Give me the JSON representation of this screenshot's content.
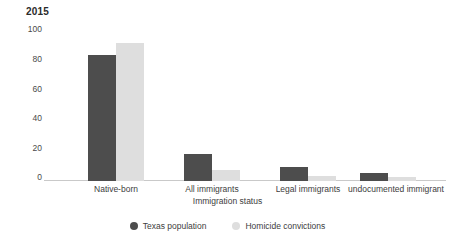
{
  "chart_data": {
    "type": "bar",
    "title": "2015",
    "xlabel": "Immigration status",
    "ylabel": "",
    "categories": [
      "Native-born",
      "All immigrants",
      "Legal immigrants",
      "undocumented immigrant"
    ],
    "series": [
      {
        "name": "Texas population",
        "color": "#4d4d4d",
        "values": [
          80,
          17,
          9,
          5
        ]
      },
      {
        "name": "Homicide convictions",
        "color": "#dedede",
        "values": [
          88,
          7,
          3,
          2.5
        ]
      }
    ],
    "ylim": [
      0,
      100
    ],
    "yticks": [
      "0",
      "20",
      "40",
      "60",
      "80",
      "100"
    ],
    "grid": false,
    "legend_position": "bottom"
  },
  "legend": {
    "items": [
      {
        "label": "Texas population"
      },
      {
        "label": "Homicide convictions"
      }
    ]
  }
}
